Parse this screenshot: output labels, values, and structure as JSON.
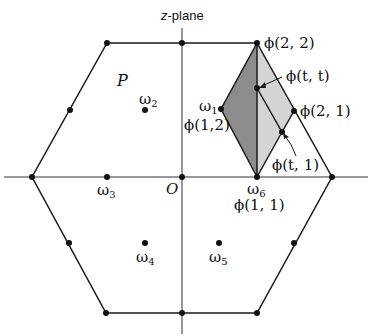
{
  "title": {
    "var": "z",
    "rest": "-plane"
  },
  "colors": {
    "line": "#1a1a1a",
    "dark_fill": "#8c8c8c",
    "light_fill": "#d4d4d4",
    "axis": "#333333"
  },
  "labels": {
    "P": "P",
    "O": "O",
    "omega1": {
      "sym": "ω",
      "sub": "1"
    },
    "omega2": {
      "sym": "ω",
      "sub": "2"
    },
    "omega3": {
      "sym": "ω",
      "sub": "3"
    },
    "omega4": {
      "sym": "ω",
      "sub": "4"
    },
    "omega5": {
      "sym": "ω",
      "sub": "5"
    },
    "omega6": {
      "sym": "ω",
      "sub": "6"
    },
    "phi22": "ϕ(2, 2)",
    "phitt": "ϕ(t, t)",
    "phi21": "ϕ(2, 1)",
    "phi12": "ϕ(1,2)",
    "phit1": "ϕ(t, 1)",
    "phi11": "ϕ(1, 1)"
  }
}
